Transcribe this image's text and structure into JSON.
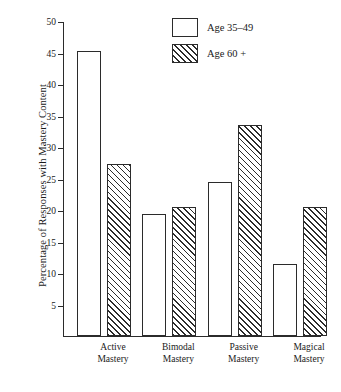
{
  "chart_data": {
    "type": "bar",
    "title": "",
    "xlabel": "",
    "ylabel": "Percentage of Responses with Mastery Content",
    "ylim": [
      0,
      50
    ],
    "yticks": [
      5,
      10,
      15,
      20,
      25,
      30,
      35,
      40,
      45,
      50
    ],
    "ytick_labels": [
      "5",
      "10",
      "15",
      "20",
      "25",
      "30",
      "35",
      "40",
      "45",
      "50"
    ],
    "grid": false,
    "legend_position": "top-right",
    "categories": [
      "Active Mastery",
      "Bimodal Mastery",
      "Passive Mastery",
      "Magical Mastery"
    ],
    "category_lines": [
      [
        "Active",
        "Mastery"
      ],
      [
        "Bimodal",
        "Mastery"
      ],
      [
        "Passive",
        "Mastery"
      ],
      [
        "Magical",
        "Mastery"
      ]
    ],
    "series": [
      {
        "name": "Age 35–49",
        "fill": "open",
        "values": [
          45.2,
          19.3,
          24.4,
          11.4
        ]
      },
      {
        "name": "Age 60 +",
        "fill": "diagonal-hatch",
        "values": [
          27.3,
          20.4,
          33.5,
          20.5
        ]
      }
    ],
    "colors": {
      "ink": "#2b2b2b",
      "background": "#ffffff"
    }
  },
  "legend": {
    "items": [
      {
        "label": "Age 35–49",
        "swatch": "open-square"
      },
      {
        "label": "Age 60 +",
        "swatch": "hatched-square"
      }
    ]
  }
}
